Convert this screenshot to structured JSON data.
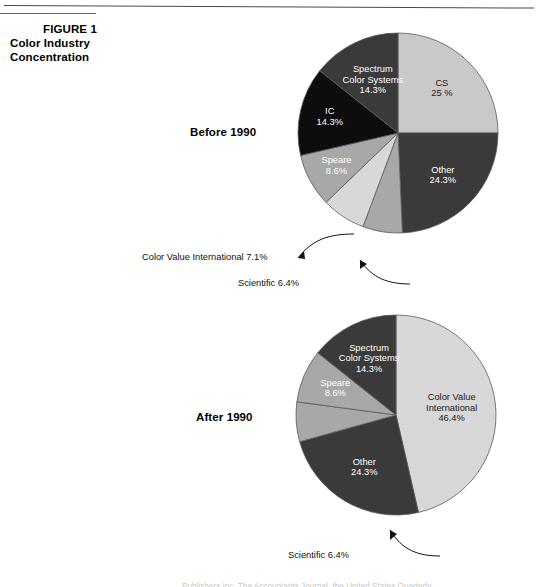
{
  "figure": {
    "number_label": "FIGURE 1",
    "title_line_1": "Color Industry",
    "title_line_2": "Concentration"
  },
  "groups": {
    "before_label": "Before 1990",
    "after_label": "After 1990"
  },
  "colors": {
    "light_gray": "#c9c9c9",
    "mid_gray": "#a8a8a8",
    "pale_gray": "#d8d8d8",
    "dark_gray": "#3a3a3a",
    "black": "#0d0d0d",
    "outline": "#5a5a5a",
    "text": "#000000",
    "label_on_dark": "#ffffff"
  },
  "callouts": {
    "color_value_international_before": "Color Value International 7.1%",
    "scientific_before": "Scientific 6.4%",
    "scientific_after": "Scientific 6.4%"
  },
  "footer": {
    "text": "Publishers Inc. The Accountants Journal, the United States Quarterly"
  },
  "chart_data": [
    {
      "type": "pie",
      "title": "Before 1990",
      "start_angle": 0,
      "direction": "clockwise",
      "categories": [
        "CS",
        "Other",
        "Scientific",
        "Color Value International",
        "Speare",
        "IC",
        "Spectrum Color Systems"
      ],
      "values": [
        25.0,
        24.3,
        6.4,
        7.1,
        8.6,
        14.3,
        14.3
      ],
      "slices": [
        {
          "name": "CS",
          "label_line_1": "CS",
          "label_line_2": "25 %",
          "value": 25.0,
          "color": "#c9c9c9",
          "label_placement": "inside",
          "label_color": "on-light"
        },
        {
          "name": "Other",
          "label_line_1": "Other",
          "label_line_2": "24.3%",
          "value": 24.3,
          "color": "#3a3a3a",
          "label_placement": "inside",
          "label_color": "on-dark"
        },
        {
          "name": "Scientific",
          "label_line_1": "Scientific 6.4%",
          "label_line_2": "",
          "value": 6.4,
          "color": "#a8a8a8",
          "label_placement": "callout",
          "label_color": "on-light"
        },
        {
          "name": "Color Value International",
          "label_line_1": "Color Value International 7.1%",
          "label_line_2": "",
          "value": 7.1,
          "color": "#d8d8d8",
          "label_placement": "callout",
          "label_color": "on-light"
        },
        {
          "name": "Speare",
          "label_line_1": "Speare",
          "label_line_2": "8.6%",
          "value": 8.6,
          "color": "#a8a8a8",
          "label_placement": "inside",
          "label_color": "on-dark"
        },
        {
          "name": "IC",
          "label_line_1": "IC",
          "label_line_2": "14.3%",
          "value": 14.3,
          "color": "#0d0d0d",
          "label_placement": "inside",
          "label_color": "on-dark"
        },
        {
          "name": "Spectrum Color Systems",
          "label_line_1": "Spectrum",
          "label_line_2": "Color Systems",
          "label_line_3": "14.3%",
          "value": 14.3,
          "color": "#3a3a3a",
          "label_placement": "inside",
          "label_color": "on-dark"
        }
      ]
    },
    {
      "type": "pie",
      "title": "After 1990",
      "start_angle": 0,
      "direction": "clockwise",
      "categories": [
        "Color Value International",
        "Other",
        "Scientific",
        "Speare",
        "Spectrum Color Systems"
      ],
      "values": [
        46.4,
        24.3,
        6.4,
        8.6,
        14.3
      ],
      "slices": [
        {
          "name": "Color Value International",
          "label_line_1": "Color Value",
          "label_line_2": "International",
          "label_line_3": "46.4%",
          "value": 46.4,
          "color": "#d8d8d8",
          "label_placement": "inside",
          "label_color": "on-light"
        },
        {
          "name": "Other",
          "label_line_1": "Other",
          "label_line_2": "24.3%",
          "value": 24.3,
          "color": "#3a3a3a",
          "label_placement": "inside",
          "label_color": "on-dark"
        },
        {
          "name": "Scientific",
          "label_line_1": "Scientific 6.4%",
          "label_line_2": "",
          "value": 6.4,
          "color": "#a8a8a8",
          "label_placement": "callout",
          "label_color": "on-light"
        },
        {
          "name": "Speare",
          "label_line_1": "Speare",
          "label_line_2": "8.6%",
          "value": 8.6,
          "color": "#a8a8a8",
          "label_placement": "inside",
          "label_color": "on-dark"
        },
        {
          "name": "Spectrum Color Systems",
          "label_line_1": "Spectrum",
          "label_line_2": "Color Systems",
          "label_line_3": "14.3%",
          "value": 14.3,
          "color": "#3a3a3a",
          "label_placement": "inside",
          "label_color": "on-dark"
        }
      ]
    }
  ]
}
